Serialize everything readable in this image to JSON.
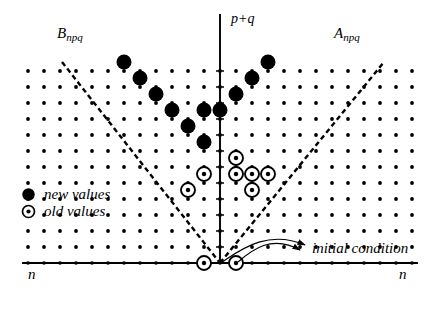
{
  "figure": {
    "type": "lattice-diagram",
    "width": 439,
    "height": 316,
    "background": "#ffffff",
    "ink": "#000000"
  },
  "labels": {
    "region_left_base": "B",
    "region_left_sub": "npq",
    "region_right_base": "A",
    "region_right_sub": "npq",
    "axis_vertical": "p+q",
    "axis_horizontal_left": "n",
    "axis_horizontal_right": "n",
    "annotation": "initial condition"
  },
  "legend": {
    "items": [
      {
        "marker": "filled-dot",
        "label": "new values"
      },
      {
        "marker": "circled-dot",
        "label": "old values"
      }
    ]
  },
  "chart_data": {
    "type": "scatter",
    "title": "",
    "xlabel": "n",
    "ylabel": "p+q",
    "grid": true,
    "origin_px": [
      220,
      263
    ],
    "step_px": 16,
    "xlim": [
      -13,
      13
    ],
    "ylim": [
      0,
      13
    ],
    "axes": {
      "horizontal_y": 263,
      "vertical_x": 220,
      "horizontal_from_px": 22,
      "horizontal_to_px": 418,
      "vertical_from_px": 14,
      "vertical_to_px": 263
    },
    "lattice": {
      "description": "regular grid of small dots filling the plot area",
      "cols_left": 12,
      "cols_right": 12,
      "rows": 12,
      "dot_radius": 1.9
    },
    "series": [
      {
        "name": "new values",
        "marker": "filled-dot",
        "radius": 7.5,
        "points_px": [
          [
            124,
            62
          ],
          [
            140,
            78
          ],
          [
            156,
            94
          ],
          [
            172,
            110
          ],
          [
            188,
            126
          ],
          [
            204,
            142
          ],
          [
            268,
            62
          ],
          [
            252,
            78
          ],
          [
            236,
            94
          ],
          [
            220,
            110
          ],
          [
            204,
            110
          ]
        ],
        "points_grid": [
          [
            -6,
            12
          ],
          [
            -5,
            11
          ],
          [
            -4,
            10
          ],
          [
            -3,
            9
          ],
          [
            -2,
            8
          ],
          [
            -1,
            7
          ],
          [
            3,
            12
          ],
          [
            2,
            11
          ],
          [
            1,
            10
          ],
          [
            0,
            9
          ],
          [
            -1,
            9
          ]
        ]
      },
      {
        "name": "old values",
        "marker": "circled-dot",
        "outer_radius": 7.0,
        "inner_radius": 2.2,
        "points_px": [
          [
            236,
            158
          ],
          [
            252,
            174
          ],
          [
            236,
            174
          ],
          [
            268,
            174
          ],
          [
            252,
            190
          ],
          [
            204,
            174
          ],
          [
            188,
            190
          ],
          [
            204,
            263
          ],
          [
            236,
            263
          ]
        ],
        "points_grid": [
          [
            1,
            8
          ],
          [
            2,
            7
          ],
          [
            1,
            7
          ],
          [
            3,
            7
          ],
          [
            2,
            6
          ],
          [
            -1,
            7
          ],
          [
            -2,
            6
          ],
          [
            -1,
            0
          ],
          [
            1,
            0
          ]
        ]
      }
    ],
    "boundaries": [
      {
        "name": "left-dashed-ray",
        "style": "dashed",
        "from_px": [
          62,
          62
        ],
        "to_px": [
          220,
          263
        ],
        "slope_note": "descends from upper-left to origin"
      },
      {
        "name": "right-dashed-ray",
        "style": "dashed",
        "from_px": [
          220,
          263
        ],
        "to_px": [
          384,
          62
        ],
        "slope_note": "ascends from origin to upper-right"
      }
    ],
    "annotations": [
      {
        "text": "initial condition",
        "text_px": [
          312,
          248
        ],
        "leaders": [
          {
            "from_px": [
              305,
              245
            ],
            "to_px": [
              222,
              262
            ]
          },
          {
            "from_px": [
              300,
              250
            ],
            "to_px": [
              238,
              262
            ]
          }
        ]
      }
    ]
  }
}
